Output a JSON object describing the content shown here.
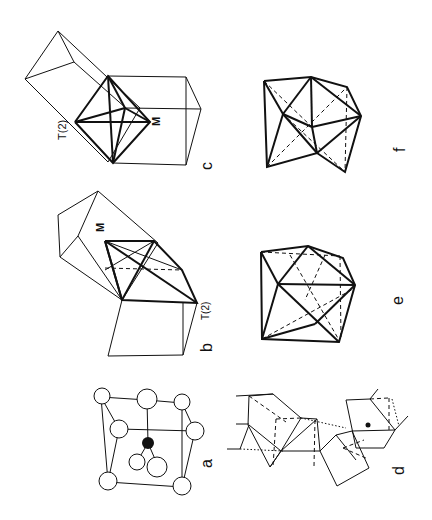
{
  "figure": {
    "orientation": "rotated 90 degrees clockwise",
    "panels": [
      {
        "id": "a",
        "label": "a",
        "description": "cubic unit cell with atoms at corners and faces, one dark central atom"
      },
      {
        "id": "b",
        "label": "b",
        "description": "coordination polyhedron in cube with atom labels",
        "atom_labels": [
          "M",
          "T(2)"
        ]
      },
      {
        "id": "c",
        "label": "c",
        "description": "coordination polyhedron in cube with atom labels",
        "atom_labels": [
          "T(2)",
          "M"
        ]
      },
      {
        "id": "d",
        "label": "d",
        "description": "chain of linked polyhedra with dotted connections and a dark atom"
      },
      {
        "id": "e",
        "label": "e",
        "description": "polyhedron with solid and dashed edges"
      },
      {
        "id": "f",
        "label": "f",
        "description": "polyhedron with solid and dashed edges"
      }
    ]
  },
  "labels": {
    "a": "a",
    "b": "b",
    "c": "c",
    "d": "d",
    "e": "e",
    "f": "f",
    "b_M": "M",
    "b_T2": "T(2)",
    "c_T2": "T(2)",
    "c_M": "M"
  }
}
